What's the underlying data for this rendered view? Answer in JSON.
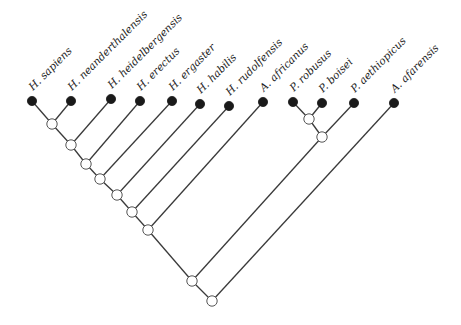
{
  "diagram": {
    "type": "cladogram",
    "colors": {
      "edge": "#3a3a3a",
      "tip_fill": "#1a1a1a",
      "internal_fill": "#ffffff",
      "internal_stroke": "#555555",
      "label": "#222222"
    },
    "tips": [
      {
        "id": "t0",
        "label": "H. sapiens",
        "x": 32,
        "y": 101
      },
      {
        "id": "t1",
        "label": "H. neanderthalensis",
        "x": 71,
        "y": 101
      },
      {
        "id": "t2",
        "label": "H. heidelbergensis",
        "x": 111,
        "y": 99
      },
      {
        "id": "t3",
        "label": "H. erectus",
        "x": 140,
        "y": 101
      },
      {
        "id": "t4",
        "label": "H. ergaster",
        "x": 172,
        "y": 101
      },
      {
        "id": "t5",
        "label": "H. habilis",
        "x": 200,
        "y": 104
      },
      {
        "id": "t6",
        "label": "H. rudolfensis",
        "x": 229,
        "y": 106
      },
      {
        "id": "t7",
        "label": "A. africanus",
        "x": 263,
        "y": 102
      },
      {
        "id": "t8",
        "label": "P. robusus",
        "x": 293,
        "y": 102
      },
      {
        "id": "t9",
        "label": "P. boisei",
        "x": 322,
        "y": 103
      },
      {
        "id": "t10",
        "label": "P. aethiopicus",
        "x": 354,
        "y": 103
      },
      {
        "id": "t11",
        "label": "A. afarensis",
        "x": 394,
        "y": 103
      }
    ],
    "internal_nodes": [
      {
        "id": "n1",
        "x": 52,
        "y": 124
      },
      {
        "id": "n2",
        "x": 71,
        "y": 145
      },
      {
        "id": "n3",
        "x": 86,
        "y": 164
      },
      {
        "id": "n4",
        "x": 100,
        "y": 179
      },
      {
        "id": "n5",
        "x": 117,
        "y": 195
      },
      {
        "id": "n6",
        "x": 132,
        "y": 212
      },
      {
        "id": "n7",
        "x": 148,
        "y": 230
      },
      {
        "id": "p1",
        "x": 309,
        "y": 119
      },
      {
        "id": "p2",
        "x": 322,
        "y": 137
      },
      {
        "id": "n8",
        "x": 192,
        "y": 281
      },
      {
        "id": "n9",
        "x": 212,
        "y": 301
      }
    ],
    "edges": [
      [
        "n1",
        "t0"
      ],
      [
        "n1",
        "t1"
      ],
      [
        "n2",
        "n1"
      ],
      [
        "n2",
        "t2"
      ],
      [
        "n3",
        "n2"
      ],
      [
        "n3",
        "t3"
      ],
      [
        "n4",
        "n3"
      ],
      [
        "n4",
        "t4"
      ],
      [
        "n5",
        "n4"
      ],
      [
        "n5",
        "t5"
      ],
      [
        "n6",
        "n5"
      ],
      [
        "n6",
        "t6"
      ],
      [
        "n7",
        "n6"
      ],
      [
        "n7",
        "t7"
      ],
      [
        "p1",
        "t8"
      ],
      [
        "p1",
        "t9"
      ],
      [
        "p2",
        "p1"
      ],
      [
        "p2",
        "t10"
      ],
      [
        "n8",
        "n7"
      ],
      [
        "n8",
        "p2"
      ],
      [
        "n9",
        "n8"
      ],
      [
        "n9",
        "t11"
      ]
    ]
  }
}
